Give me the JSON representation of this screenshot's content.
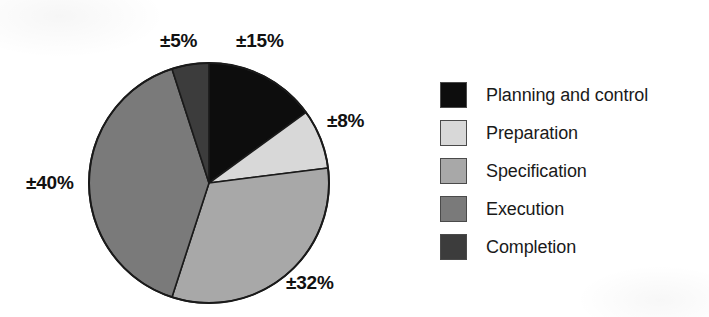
{
  "chart_data": {
    "type": "pie",
    "title": "",
    "subtitle": "",
    "xlabel": "",
    "ylabel": "",
    "legend_position": "right",
    "grid": false,
    "units": "percent",
    "total": 100,
    "categories": [
      "Planning and control",
      "Preparation",
      "Specification",
      "Execution",
      "Completion"
    ],
    "values": [
      15,
      8,
      32,
      40,
      5
    ],
    "labels": [
      "±15%",
      "±8%",
      "±32%",
      "±40%",
      "±5%"
    ],
    "colors": [
      "#0d0d0d",
      "#d8d8d8",
      "#a8a8a8",
      "#7a7a7a",
      "#3c3c3c"
    ],
    "start_angle_deg": 0,
    "direction": "clockwise",
    "slices": [
      {
        "name": "Planning and control",
        "value": 15,
        "label": "±15%",
        "color": "#0d0d0d",
        "start_deg": 0,
        "end_deg": 54
      },
      {
        "name": "Preparation",
        "value": 8,
        "label": "±8%",
        "color": "#d8d8d8",
        "start_deg": 54,
        "end_deg": 82.8
      },
      {
        "name": "Specification",
        "value": 32,
        "label": "±32%",
        "color": "#a8a8a8",
        "start_deg": 82.8,
        "end_deg": 198
      },
      {
        "name": "Execution",
        "value": 40,
        "label": "±40%",
        "color": "#7a7a7a",
        "start_deg": 198,
        "end_deg": 342
      },
      {
        "name": "Completion",
        "value": 5,
        "label": "±5%",
        "color": "#3c3c3c",
        "start_deg": 342,
        "end_deg": 360
      }
    ]
  },
  "pie": {
    "center_x": 209,
    "center_y": 183,
    "radius": 120,
    "outline_color": "#1a1a1a",
    "labels": {
      "planning": "±15%",
      "preparation": "±8%",
      "specification": "±32%",
      "execution": "±40%",
      "completion": "±5%"
    }
  },
  "legend": {
    "items": [
      {
        "label": "Planning and control",
        "color": "#0d0d0d"
      },
      {
        "label": "Preparation",
        "color": "#d8d8d8"
      },
      {
        "label": "Specification",
        "color": "#a8a8a8"
      },
      {
        "label": "Execution",
        "color": "#7a7a7a"
      },
      {
        "label": "Completion",
        "color": "#3c3c3c"
      }
    ]
  }
}
